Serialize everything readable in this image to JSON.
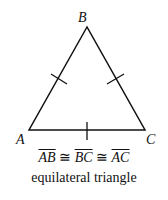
{
  "diagram": {
    "vertices": {
      "top": "B",
      "left": "A",
      "right": "C"
    },
    "congruence": {
      "segments": [
        "AB",
        "BC",
        "AC"
      ],
      "symbol": "≅"
    },
    "caption": "equilateral triangle"
  }
}
